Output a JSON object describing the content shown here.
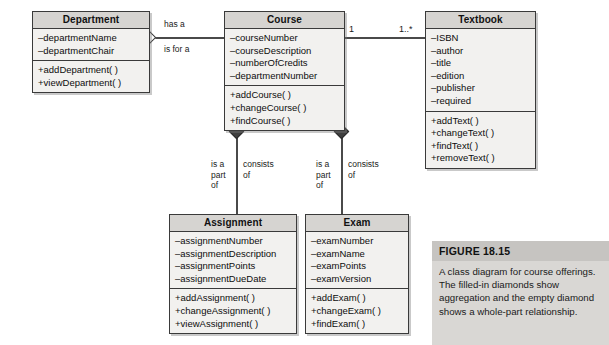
{
  "diagram": {
    "type": "uml-class-diagram",
    "classes": [
      {
        "id": "department",
        "name": "Department",
        "attributes": [
          "–departmentName",
          "–departmentChair"
        ],
        "operations": [
          "+addDepartment( )",
          "+viewDepartment( )"
        ]
      },
      {
        "id": "course",
        "name": "Course",
        "attributes": [
          "–courseNumber",
          "–courseDescription",
          "–numberOfCredits",
          "–departmentNumber"
        ],
        "operations": [
          "+addCourse( )",
          "+changeCourse( )",
          "+findCourse( )"
        ]
      },
      {
        "id": "textbook",
        "name": "Textbook",
        "attributes": [
          "–ISBN",
          "–author",
          "–title",
          "–edition",
          "–publisher",
          "–required"
        ],
        "operations": [
          "+addText( )",
          "+changeText( )",
          "+findText( )",
          "+removeText( )"
        ]
      },
      {
        "id": "assignment",
        "name": "Assignment",
        "attributes": [
          "–assignmentNumber",
          "–assignmentDescription",
          "–assignmentPoints",
          "–assignmentDueDate"
        ],
        "operations": [
          "+addAssignment( )",
          "+changeAssignment( )",
          "+viewAssignment( )"
        ]
      },
      {
        "id": "exam",
        "name": "Exam",
        "attributes": [
          "–examNumber",
          "–examName",
          "–examPoints",
          "–examVersion"
        ],
        "operations": [
          "+addExam( )",
          "+changeExam( )",
          "+findExam( )"
        ]
      }
    ],
    "relationships": {
      "department_course": {
        "label_top": "has a",
        "label_bottom": "is for a",
        "diamond": "empty"
      },
      "course_textbook": {
        "multiplicity_left": "1",
        "multiplicity_right": "1..*"
      },
      "course_assignment": {
        "role_part": "is a\npart\nof",
        "role_whole": "consists\nof",
        "diamond": "filled"
      },
      "course_exam": {
        "role_part": "is a\npart\nof",
        "role_whole": "consists\nof",
        "diamond": "filled"
      }
    }
  },
  "figure": {
    "title": "FIGURE 18.15",
    "body": "A class diagram for course offerings. The filled-in diamonds show aggregation and the empty diamond shows a whole-part relationship."
  },
  "colors": {
    "box_fill": "#f2f1ef",
    "header_fill": "#d6d4d1",
    "border": "#3a3a3a",
    "line": "#4a4a4a",
    "caption_fill": "#d9d7d4",
    "caption_title_fill": "#c6c4c1"
  }
}
